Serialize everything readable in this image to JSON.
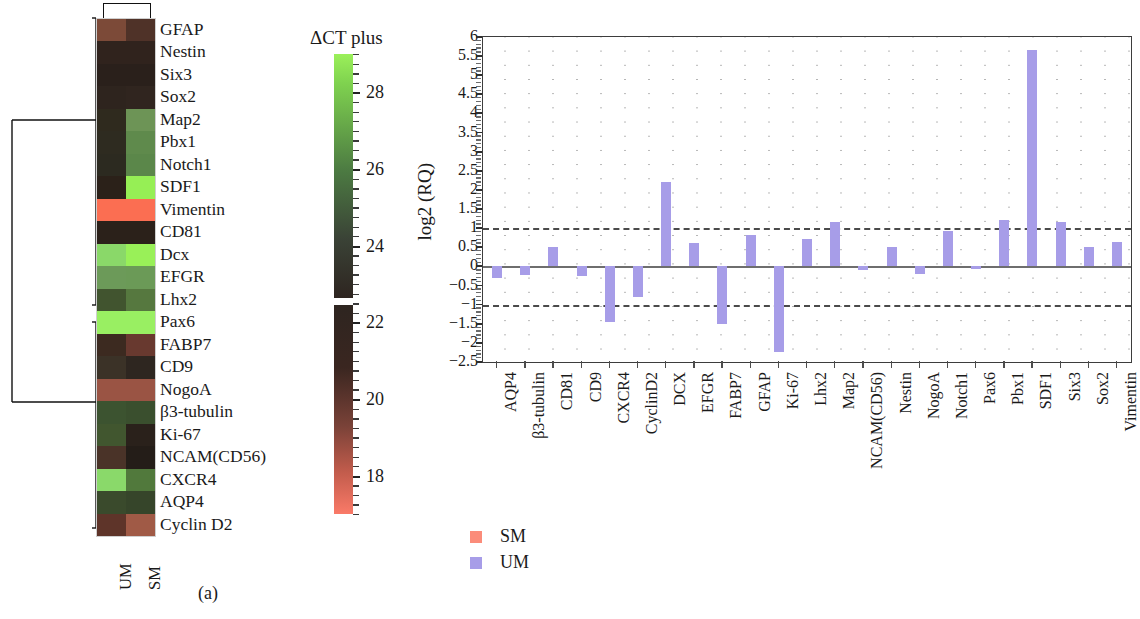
{
  "figure": {
    "panel_a_caption": "(a)",
    "panel_b_caption": "(b)"
  },
  "panel_a": {
    "colorbar": {
      "title": "ΔCT plus",
      "ticks": [
        28,
        26,
        24,
        22,
        20,
        18
      ],
      "range": [
        17.0,
        29.0
      ],
      "colors": {
        "high": "#9bf05a",
        "mid_green": "#4c7a42",
        "dark": "#2e2520",
        "mid_red": "#7a4238",
        "low": "#fa7a68"
      }
    },
    "column_labels": [
      "UM",
      "SM"
    ],
    "rows": [
      {
        "gene": "GFAP",
        "UM": "#7c4a38",
        "SM": "#4f3228"
      },
      {
        "gene": "Nestin",
        "UM": "#30231d",
        "SM": "#30231d"
      },
      {
        "gene": "Six3",
        "UM": "#2a201b",
        "SM": "#2a201b"
      },
      {
        "gene": "Sox2",
        "UM": "#2e241e",
        "SM": "#30251f"
      },
      {
        "gene": "Map2",
        "UM": "#2f2a1e",
        "SM": "#6d9456"
      },
      {
        "gene": "Pbx1",
        "UM": "#2e2b20",
        "SM": "#5f8a4c"
      },
      {
        "gene": "Notch1",
        "UM": "#2c2a20",
        "SM": "#5b874a"
      },
      {
        "gene": "SDF1",
        "UM": "#2b2119",
        "SM": "#96ef55"
      },
      {
        "gene": "Vimentin",
        "UM": "#fb6e52",
        "SM": "#fb6e52"
      },
      {
        "gene": "CD81",
        "UM": "#2b211a",
        "SM": "#2b211a"
      },
      {
        "gene": "Dcx",
        "UM": "#8ad869",
        "SM": "#99f058"
      },
      {
        "gene": "EFGR",
        "UM": "#6c9a59",
        "SM": "#6b9a57"
      },
      {
        "gene": "Lhx2",
        "UM": "#41542f",
        "SM": "#56783f"
      },
      {
        "gene": "Pax6",
        "UM": "#99ef62",
        "SM": "#99ef62"
      },
      {
        "gene": "FABP7",
        "UM": "#3c2a20",
        "SM": "#68392f"
      },
      {
        "gene": "CD9",
        "UM": "#3b3227",
        "SM": "#2e2620"
      },
      {
        "gene": "NogoA",
        "UM": "#9a5444",
        "SM": "#9a5444"
      },
      {
        "gene": "β3-tubulin",
        "UM": "#3c5330",
        "SM": "#3a4f2e"
      },
      {
        "gene": "Ki-67",
        "UM": "#41562f",
        "SM": "#2a211b"
      },
      {
        "gene": "NCAM(CD56)",
        "UM": "#4a3328",
        "SM": "#241d18"
      },
      {
        "gene": "CXCR4",
        "UM": "#8ad96a",
        "SM": "#51793c"
      },
      {
        "gene": "AQP4",
        "UM": "#3a4a2c",
        "SM": "#36452a"
      },
      {
        "gene": "Cyclin D2",
        "UM": "#5e3429",
        "SM": "#a05a46"
      }
    ],
    "dendrogram": {
      "cluster_split_after_row": 13,
      "description": "two-cluster hierarchical dendrogram on gene rows"
    }
  },
  "panel_b": {
    "legend": [
      {
        "label": "SM",
        "color": "#fb8c7a"
      },
      {
        "label": "UM",
        "color": "#a79de8"
      }
    ],
    "chart_data": {
      "type": "bar",
      "title": "",
      "xlabel": "",
      "ylabel": "log2 (RQ)",
      "ylim": [
        -2.5,
        6
      ],
      "yticks": [
        6,
        5.5,
        5,
        4.5,
        4,
        3.5,
        3,
        2.5,
        2,
        1.5,
        1,
        0.5,
        0,
        -0.5,
        -1,
        -1.5,
        -2,
        -2.5
      ],
      "ytick_labels": [
        "6",
        "5.5",
        "5",
        "4.5",
        "4",
        "3.5",
        "3",
        "2.5",
        "2",
        "1.5",
        "1",
        "0.5",
        "0",
        "−0.5",
        "−1",
        "−1.5",
        "−2",
        "−2.5"
      ],
      "grid": true,
      "legend_position": "bottom-left",
      "reference_lines": [
        1,
        -1
      ],
      "categories": [
        "AQP4",
        "β3-tubulin",
        "CD81",
        "CD9",
        "CXCR4",
        "CyclinD2",
        "DCX",
        "EFGR",
        "FABP7",
        "GFAP",
        "Ki-67",
        "Lhx2",
        "Map2",
        "NCAM(CD56)",
        "Nestin",
        "NogoA",
        "Notch1",
        "Pax6",
        "Pbx1",
        "SDF1",
        "Six3",
        "Sox2",
        "Vimentin"
      ],
      "series": [
        {
          "name": "UM",
          "color": "#a79de8",
          "values": [
            -0.3,
            -0.22,
            0.52,
            -0.25,
            -1.45,
            -0.8,
            2.2,
            0.6,
            -1.5,
            0.82,
            -2.25,
            0.72,
            1.15,
            -0.1,
            0.52,
            -0.2,
            0.92,
            -0.07,
            1.22,
            5.65,
            1.15,
            0.5,
            0.65
          ]
        }
      ]
    }
  }
}
